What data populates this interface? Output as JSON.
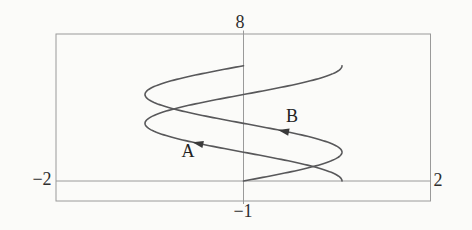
{
  "chart_data": {
    "type": "line",
    "window": {
      "xmin": -2,
      "xmax": 2,
      "ymin": -1,
      "ymax": 8
    },
    "tick_labels": {
      "top": "8",
      "bottom": "−1",
      "left": "−2",
      "right": "2"
    },
    "axes": {
      "x_axis_at_y": 0,
      "y_axis_at_x": 0,
      "grid": false,
      "style": "calculator-viewing-window"
    },
    "curves": [
      {
        "id": "curve-B",
        "label": "B",
        "equation": "x = sin(y)",
        "fn": "sin",
        "y_domain": [
          0,
          6.2832
        ],
        "arrow_y": 2.72,
        "direction": "arrow points up-left (increasing y)",
        "key_points": [
          [
            0,
            0
          ],
          [
            1,
            1.571
          ],
          [
            0,
            3.142
          ],
          [
            -1,
            4.712
          ],
          [
            0,
            6.283
          ]
        ]
      },
      {
        "id": "curve-A",
        "label": "A",
        "equation": "x = cos(y)",
        "fn": "cos",
        "y_domain": [
          0,
          6.2832
        ],
        "arrow_y": 2.05,
        "direction": "arrow points up-left (increasing y)",
        "key_points": [
          [
            1,
            0
          ],
          [
            0,
            1.571
          ],
          [
            -1,
            3.142
          ],
          [
            0,
            4.712
          ],
          [
            1,
            6.283
          ]
        ]
      }
    ],
    "colors": {
      "curve": "#58585a",
      "frame": "#9a9a9a",
      "arrow": "#3a3a3a",
      "text": "#2b2b2b",
      "background": "#fbfbf9"
    }
  }
}
